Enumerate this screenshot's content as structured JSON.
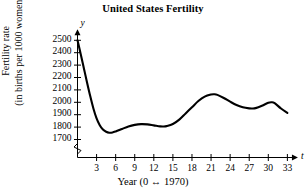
{
  "chart_data": {
    "type": "line",
    "title": "United States Fertility",
    "xlabel": "Year (0 ↔ 1970)",
    "ylabel_line1": "Fertility rate",
    "ylabel_line2": "(in births per 1000 women)",
    "x_axis_letter": "t",
    "y_axis_letter": "y",
    "xlim": [
      0,
      34.5
    ],
    "ylim": [
      1650,
      2530
    ],
    "y_axis_break": true,
    "grid": false,
    "legend": null,
    "line_color": "#000000",
    "x_ticks": [
      3,
      6,
      9,
      12,
      15,
      18,
      21,
      24,
      27,
      30,
      33
    ],
    "x_tick_labels": [
      "3",
      "6",
      "9",
      "12",
      "15",
      "18",
      "21",
      "24",
      "27",
      "30",
      "33"
    ],
    "y_ticks": [
      1700,
      1800,
      1900,
      2000,
      2100,
      2200,
      2300,
      2400,
      2500
    ],
    "y_tick_labels": [
      "1700",
      "1800",
      "1900",
      "2000",
      "2100",
      "2200",
      "2300",
      "2400",
      "2500"
    ],
    "x": [
      0,
      0.5,
      1,
      1.5,
      2,
      2.5,
      3,
      3.5,
      4,
      4.5,
      5,
      5.5,
      6,
      7,
      8,
      9,
      10,
      11,
      12,
      13,
      13.5,
      14,
      15,
      16,
      17,
      18,
      19,
      20,
      21,
      21.5,
      22,
      23,
      24,
      25,
      26,
      27,
      27.5,
      28,
      29,
      30,
      30.5,
      31,
      32,
      33
    ],
    "values": [
      2500,
      2390,
      2275,
      2160,
      2050,
      1950,
      1870,
      1815,
      1780,
      1762,
      1755,
      1757,
      1765,
      1785,
      1805,
      1818,
      1824,
      1822,
      1814,
      1806,
      1805,
      1808,
      1825,
      1860,
      1910,
      1960,
      2010,
      2046,
      2063,
      2065,
      2060,
      2035,
      2005,
      1978,
      1960,
      1951,
      1950,
      1953,
      1972,
      1996,
      2000,
      1993,
      1950,
      1915
    ],
    "annotations": []
  }
}
